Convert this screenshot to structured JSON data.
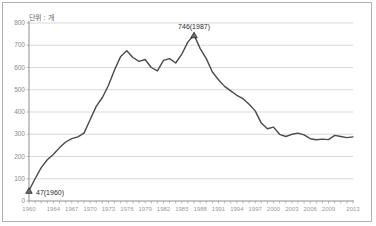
{
  "chart_data": {
    "type": "line",
    "unit_label": "단위 : 개",
    "title": "",
    "xlabel": "",
    "ylabel": "",
    "ylim": [
      0,
      800
    ],
    "ytick_interval": 100,
    "yticks": [
      "0",
      "100",
      "200",
      "300",
      "400",
      "500",
      "600",
      "700",
      "800"
    ],
    "xticks": [
      "1960",
      "1964",
      "1967",
      "1970",
      "1973",
      "1976",
      "1979",
      "1982",
      "1985",
      "1988",
      "1991",
      "1994",
      "1997",
      "2000",
      "2003",
      "2006",
      "2009",
      "2013"
    ],
    "grid": "horizontal",
    "legend": "none",
    "x_range": [
      1960,
      2013
    ],
    "x": [
      1960,
      1961,
      1962,
      1963,
      1964,
      1965,
      1966,
      1967,
      1968,
      1969,
      1970,
      1971,
      1972,
      1973,
      1974,
      1975,
      1976,
      1977,
      1978,
      1979,
      1980,
      1981,
      1982,
      1983,
      1984,
      1985,
      1986,
      1987,
      1988,
      1989,
      1990,
      1991,
      1992,
      1993,
      1994,
      1995,
      1996,
      1997,
      1998,
      1999,
      2000,
      2001,
      2002,
      2003,
      2004,
      2005,
      2006,
      2007,
      2008,
      2009,
      2010,
      2011,
      2012,
      2013
    ],
    "values": [
      47,
      100,
      150,
      185,
      210,
      240,
      265,
      280,
      288,
      305,
      365,
      425,
      465,
      520,
      590,
      650,
      675,
      645,
      628,
      636,
      600,
      585,
      632,
      640,
      620,
      660,
      715,
      746,
      685,
      640,
      580,
      545,
      515,
      495,
      475,
      460,
      435,
      405,
      350,
      325,
      332,
      300,
      290,
      300,
      305,
      297,
      280,
      275,
      278,
      276,
      295,
      290,
      285,
      288
    ],
    "annotations": [
      {
        "label": "47(1960)",
        "year": 1960,
        "value": 47,
        "marker": "triangle"
      },
      {
        "label": "746(1987)",
        "year": 1987,
        "value": 746,
        "marker": "triangle"
      }
    ],
    "colors": {
      "line": "#4a4a4a",
      "grid": "#c9c9c9",
      "axis": "#8f8f8f",
      "tick_text": "#9a9a9a",
      "annotation_text": "#2b2b2b",
      "background": "#ffffff",
      "frame_border": "#b0b0b0"
    }
  }
}
